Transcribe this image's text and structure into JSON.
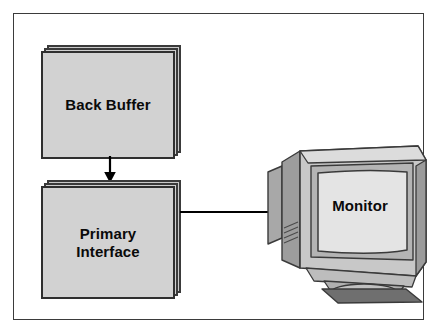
{
  "diagram": {
    "frame": {
      "border_color": "#3b3b3b",
      "background_color": "#ffffff"
    },
    "nodes": [
      {
        "id": "back-buffer",
        "label": "Back Buffer",
        "shape": "stacked-rectangle",
        "fill_color": "#d2d2d2",
        "border_color": "#2f2f2f"
      },
      {
        "id": "primary-interface",
        "label": "Primary\nInterface",
        "shape": "stacked-rectangle",
        "fill_color": "#d2d2d2",
        "border_color": "#2f2f2f"
      },
      {
        "id": "monitor",
        "label": "Monitor",
        "shape": "crt-monitor-illustration",
        "body_color": "#c8c8c8",
        "screen_color": "#e2e2e2",
        "shadow_color": "#8f8f8f",
        "base_color": "#6e6e6e"
      }
    ],
    "edges": [
      {
        "id": "edge-backbuffer-to-primary",
        "from": "back-buffer",
        "to": "primary-interface",
        "direction": "down",
        "style": "solid-arrow",
        "color": "#000000"
      },
      {
        "id": "edge-primary-to-monitor",
        "from": "primary-interface",
        "to": "monitor",
        "direction": "right",
        "style": "solid-arrow",
        "color": "#000000"
      }
    ]
  }
}
